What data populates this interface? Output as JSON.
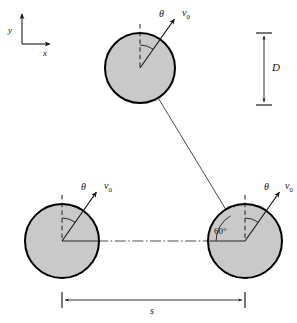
{
  "figure": {
    "background_color": "#ffffff",
    "circle_fill_color": "#c9c9c9",
    "circle_stroke_color": "#000000",
    "line_color": "#1a1a1a",
    "text_color": "#111111"
  },
  "axes": {
    "name": "coordinate-axes",
    "origin": {
      "x": 22,
      "y": 44
    },
    "y_label": "y",
    "x_label": "x",
    "y_tip": {
      "x": 22,
      "y": 12
    },
    "x_tip": {
      "x": 52,
      "y": 44
    }
  },
  "circles": [
    {
      "id": "top-circle",
      "label": "top",
      "cx": 140,
      "cy": 68,
      "r": 35,
      "theta_label": "θ",
      "v0_label": "v",
      "v0_subscript": "0"
    },
    {
      "id": "bottom-left-circle",
      "label": "bottom-left",
      "cx": 62,
      "cy": 241,
      "r": 37,
      "theta_label": "θ",
      "v0_label": "v",
      "v0_subscript": "0"
    },
    {
      "id": "bottom-right-circle",
      "label": "bottom-right",
      "cx": 245,
      "cy": 241,
      "r": 37,
      "theta_label": "θ",
      "v0_label": "v",
      "v0_subscript": "0"
    }
  ],
  "angles": {
    "theta_symbol": "θ",
    "sixty_degrees": "60°",
    "sixty_degrees_value": 60,
    "theta_from_vertical_deg": 35
  },
  "dimensions": {
    "vertical": {
      "name": "D",
      "label": "D",
      "x": 264,
      "y_top": 33,
      "y_bottom": 105
    },
    "horizontal": {
      "name": "s",
      "label": "s",
      "y": 300,
      "x_left": 62,
      "x_right": 245
    }
  },
  "connector": {
    "name": "trajectory-line",
    "from": {
      "x": 140,
      "y": 68
    },
    "to": {
      "x": 245,
      "y": 241
    },
    "angle_label": "60°"
  },
  "centerline": {
    "name": "horizontal-centerline",
    "y": 241,
    "x_start": 62,
    "x_end": 245,
    "style": "dash-dot"
  }
}
